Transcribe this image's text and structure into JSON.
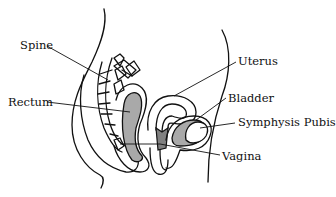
{
  "diagram": {
    "type": "anatomical-sagittal-section",
    "fill_color": "#a9a9a9",
    "line_color": "#111111",
    "labels": [
      {
        "id": "spine",
        "text": "Spine"
      },
      {
        "id": "rectum",
        "text": "Rectum"
      },
      {
        "id": "uterus",
        "text": "Uterus"
      },
      {
        "id": "bladder",
        "text": "Bladder"
      },
      {
        "id": "symphysis-pubis",
        "text": "Symphysis Pubis"
      },
      {
        "id": "vagina",
        "text": "Vagina"
      }
    ]
  }
}
